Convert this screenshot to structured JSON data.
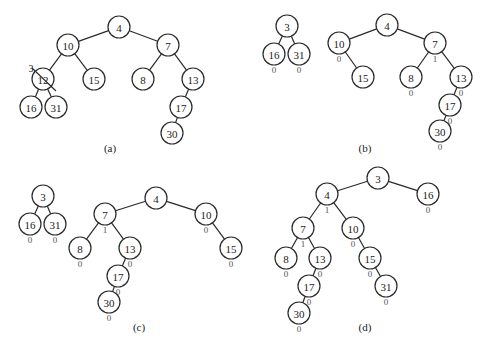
{
  "figure": {
    "node_radius": 11,
    "panels": [
      {
        "id": "a",
        "caption": "(a)",
        "caption_pos": [
          110,
          148
        ],
        "nodes": [
          {
            "id": "a4",
            "label": "4",
            "x": 119,
            "y": 27
          },
          {
            "id": "a10",
            "label": "10",
            "x": 68,
            "y": 45
          },
          {
            "id": "a7",
            "label": "7",
            "x": 168,
            "y": 45
          },
          {
            "id": "a12",
            "label": "12",
            "x": 43,
            "y": 79,
            "struck": true,
            "replacement": "3",
            "replacement_pos": [
              31,
              68
            ]
          },
          {
            "id": "a15",
            "label": "15",
            "x": 94,
            "y": 79
          },
          {
            "id": "a8",
            "label": "8",
            "x": 143,
            "y": 79
          },
          {
            "id": "a13",
            "label": "13",
            "x": 193,
            "y": 79
          },
          {
            "id": "a16",
            "label": "16",
            "x": 31,
            "y": 107
          },
          {
            "id": "a31",
            "label": "31",
            "x": 56,
            "y": 107
          },
          {
            "id": "a17",
            "label": "17",
            "x": 181,
            "y": 107
          },
          {
            "id": "a30",
            "label": "30",
            "x": 172,
            "y": 133
          }
        ],
        "edges": [
          [
            "a4",
            "a10"
          ],
          [
            "a4",
            "a7"
          ],
          [
            "a10",
            "a12"
          ],
          [
            "a10",
            "a15"
          ],
          [
            "a7",
            "a8"
          ],
          [
            "a7",
            "a13"
          ],
          [
            "a12",
            "a16"
          ],
          [
            "a12",
            "a31"
          ],
          [
            "a13",
            "a17"
          ],
          [
            "a17",
            "a30"
          ]
        ]
      },
      {
        "id": "b",
        "caption": "(b)",
        "caption_pos": [
          365,
          148
        ],
        "nodes": [
          {
            "id": "b3",
            "label": "3",
            "x": 287,
            "y": 26
          },
          {
            "id": "b16",
            "label": "16",
            "x": 274,
            "y": 54,
            "npl": "0"
          },
          {
            "id": "b31",
            "label": "31",
            "x": 299,
            "y": 54,
            "npl": "0"
          },
          {
            "id": "b4",
            "label": "4",
            "x": 387,
            "y": 25
          },
          {
            "id": "b10",
            "label": "10",
            "x": 339,
            "y": 43,
            "npl": "0"
          },
          {
            "id": "b7",
            "label": "7",
            "x": 435,
            "y": 43,
            "npl": "1"
          },
          {
            "id": "b15",
            "label": "15",
            "x": 363,
            "y": 77
          },
          {
            "id": "b8",
            "label": "8",
            "x": 411,
            "y": 77,
            "npl": "0"
          },
          {
            "id": "b13",
            "label": "13",
            "x": 461,
            "y": 77,
            "npl": "0"
          },
          {
            "id": "b17",
            "label": "17",
            "x": 450,
            "y": 105,
            "npl": "0"
          },
          {
            "id": "b30",
            "label": "30",
            "x": 440,
            "y": 131,
            "npl": "0"
          }
        ],
        "edges": [
          [
            "b3",
            "b16"
          ],
          [
            "b3",
            "b31"
          ],
          [
            "b4",
            "b10"
          ],
          [
            "b4",
            "b7"
          ],
          [
            "b10",
            "b15"
          ],
          [
            "b7",
            "b8"
          ],
          [
            "b7",
            "b13"
          ],
          [
            "b13",
            "b17"
          ],
          [
            "b17",
            "b30"
          ]
        ]
      },
      {
        "id": "c",
        "caption": "(c)",
        "caption_pos": [
          139,
          327
        ],
        "nodes": [
          {
            "id": "c3",
            "label": "3",
            "x": 43,
            "y": 196
          },
          {
            "id": "c16",
            "label": "16",
            "x": 30,
            "y": 224,
            "npl": "0"
          },
          {
            "id": "c31",
            "label": "31",
            "x": 55,
            "y": 224,
            "npl": "0"
          },
          {
            "id": "c4",
            "label": "4",
            "x": 156,
            "y": 198
          },
          {
            "id": "c7",
            "label": "7",
            "x": 105,
            "y": 214,
            "npl": "1"
          },
          {
            "id": "c10",
            "label": "10",
            "x": 206,
            "y": 214,
            "npl": "0"
          },
          {
            "id": "c8",
            "label": "8",
            "x": 80,
            "y": 248,
            "npl": "0"
          },
          {
            "id": "c13",
            "label": "13",
            "x": 130,
            "y": 248,
            "npl": "0"
          },
          {
            "id": "c15",
            "label": "15",
            "x": 231,
            "y": 248,
            "npl": "0"
          },
          {
            "id": "c17",
            "label": "17",
            "x": 118,
            "y": 276,
            "npl": "0"
          },
          {
            "id": "c30",
            "label": "30",
            "x": 109,
            "y": 302,
            "npl": "0"
          }
        ],
        "edges": [
          [
            "c3",
            "c16"
          ],
          [
            "c3",
            "c31"
          ],
          [
            "c4",
            "c7"
          ],
          [
            "c4",
            "c10"
          ],
          [
            "c7",
            "c8"
          ],
          [
            "c7",
            "c13"
          ],
          [
            "c10",
            "c15"
          ],
          [
            "c13",
            "c17"
          ],
          [
            "c17",
            "c30"
          ]
        ]
      },
      {
        "id": "d",
        "caption": "(d)",
        "caption_pos": [
          365,
          327
        ],
        "nodes": [
          {
            "id": "d3",
            "label": "3",
            "x": 378,
            "y": 178
          },
          {
            "id": "d4",
            "label": "4",
            "x": 327,
            "y": 194,
            "npl": "1"
          },
          {
            "id": "d16",
            "label": "16",
            "x": 428,
            "y": 194,
            "npl": "0"
          },
          {
            "id": "d7",
            "label": "7",
            "x": 303,
            "y": 228,
            "npl": "1"
          },
          {
            "id": "d10",
            "label": "10",
            "x": 353,
            "y": 228,
            "npl": "0"
          },
          {
            "id": "d8",
            "label": "8",
            "x": 286,
            "y": 258,
            "npl": "0"
          },
          {
            "id": "d13",
            "label": "13",
            "x": 320,
            "y": 258,
            "npl": "0"
          },
          {
            "id": "d15",
            "label": "15",
            "x": 370,
            "y": 258,
            "npl": "0"
          },
          {
            "id": "d17",
            "label": "17",
            "x": 309,
            "y": 286,
            "npl": "0"
          },
          {
            "id": "d31",
            "label": "31",
            "x": 386,
            "y": 286,
            "npl": "0"
          },
          {
            "id": "d30",
            "label": "30",
            "x": 299,
            "y": 313,
            "npl": "0"
          }
        ],
        "edges": [
          [
            "d3",
            "d4"
          ],
          [
            "d3",
            "d16"
          ],
          [
            "d4",
            "d7"
          ],
          [
            "d4",
            "d10"
          ],
          [
            "d7",
            "d8"
          ],
          [
            "d7",
            "d13"
          ],
          [
            "d10",
            "d15"
          ],
          [
            "d13",
            "d17"
          ],
          [
            "d15",
            "d31"
          ],
          [
            "d17",
            "d30"
          ]
        ]
      }
    ]
  }
}
